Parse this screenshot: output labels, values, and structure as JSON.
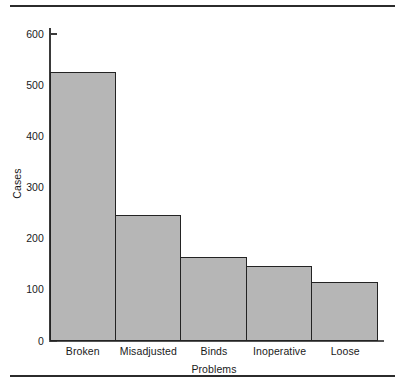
{
  "chart_data": {
    "type": "bar",
    "title": "",
    "subtitle": "",
    "xlabel": "Problems",
    "ylabel": "Cases",
    "categories": [
      "Broken",
      "Misadjusted",
      "Binds",
      "Inoperative",
      "Loose"
    ],
    "values": [
      525,
      246,
      164,
      146,
      115
    ],
    "series": [
      {
        "name": "Cases",
        "values": [
          525,
          246,
          164,
          146,
          115
        ]
      }
    ],
    "ylim": [
      0,
      620
    ],
    "y_ticks": [
      0,
      100,
      200,
      300,
      400,
      500,
      600
    ],
    "y_tick_labels": [
      "0",
      "100",
      "200",
      "300",
      "400",
      "500",
      "600"
    ],
    "x_tick_labels": [
      "Broken",
      "Misadjusted",
      "Binds",
      "Inoperative",
      "Loose"
    ],
    "grid": false,
    "legend": false,
    "legend_position": "none",
    "orientation": "vertical",
    "bar_fill_color": "#b6b6b6",
    "bar_edge_color": "#232323",
    "axis_color": "#3a3a3a",
    "background_color": "#ffffff",
    "rule_color": "#2b2b2b",
    "annotations": []
  },
  "figure": {
    "top_rule": "horizontal-rule",
    "bottom_rule": "horizontal-rule"
  }
}
